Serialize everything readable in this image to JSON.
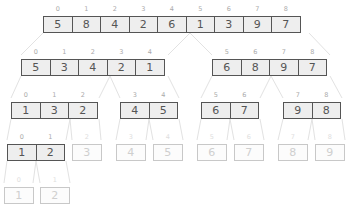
{
  "colors": {
    "active_border": "#555555",
    "active_fill": "#eeeeee",
    "faint_border": "#c8c8c8",
    "link": "#e2e2e2"
  },
  "levels": [
    {
      "level": 0,
      "arrays": [
        {
          "x": 43,
          "y": 16,
          "active": true,
          "cells": [
            {
              "i": "0",
              "v": "5"
            },
            {
              "i": "1",
              "v": "8"
            },
            {
              "i": "2",
              "v": "4"
            },
            {
              "i": "3",
              "v": "2"
            },
            {
              "i": "4",
              "v": "6"
            },
            {
              "i": "5",
              "v": "1"
            },
            {
              "i": "6",
              "v": "3"
            },
            {
              "i": "7",
              "v": "9"
            },
            {
              "i": "8",
              "v": "7"
            }
          ]
        }
      ]
    },
    {
      "level": 1,
      "arrays": [
        {
          "x": 21,
          "y": 59,
          "active": true,
          "cells": [
            {
              "i": "0",
              "v": "5"
            },
            {
              "i": "1",
              "v": "3"
            },
            {
              "i": "2",
              "v": "4"
            },
            {
              "i": "3",
              "v": "2"
            },
            {
              "i": "4",
              "v": "1"
            }
          ]
        },
        {
          "x": 212,
          "y": 59,
          "active": true,
          "cells": [
            {
              "i": "5",
              "v": "6"
            },
            {
              "i": "6",
              "v": "8"
            },
            {
              "i": "7",
              "v": "9"
            },
            {
              "i": "8",
              "v": "7"
            }
          ]
        }
      ]
    },
    {
      "level": 2,
      "arrays": [
        {
          "x": 11,
          "y": 102,
          "active": true,
          "cells": [
            {
              "i": "0",
              "v": "1"
            },
            {
              "i": "1",
              "v": "3"
            },
            {
              "i": "2",
              "v": "2"
            }
          ]
        },
        {
          "x": 120,
          "y": 102,
          "active": true,
          "cells": [
            {
              "i": "3",
              "v": "4"
            },
            {
              "i": "4",
              "v": "5"
            }
          ]
        },
        {
          "x": 201,
          "y": 102,
          "active": true,
          "cells": [
            {
              "i": "5",
              "v": "6"
            },
            {
              "i": "6",
              "v": "7"
            }
          ]
        },
        {
          "x": 283,
          "y": 102,
          "active": true,
          "cells": [
            {
              "i": "7",
              "v": "9"
            },
            {
              "i": "8",
              "v": "8"
            }
          ]
        }
      ]
    },
    {
      "level": 3,
      "arrays": [
        {
          "x": 7,
          "y": 144,
          "active": true,
          "cells": [
            {
              "i": "0",
              "v": "1"
            },
            {
              "i": "1",
              "v": "2"
            }
          ]
        },
        {
          "x": 72,
          "y": 144,
          "active": false,
          "cells": [
            {
              "i": "2",
              "v": "3"
            }
          ]
        },
        {
          "x": 116,
          "y": 144,
          "active": false,
          "cells": [
            {
              "i": "3",
              "v": "4"
            }
          ]
        },
        {
          "x": 153,
          "y": 144,
          "active": false,
          "cells": [
            {
              "i": "4",
              "v": "5"
            }
          ]
        },
        {
          "x": 197,
          "y": 144,
          "active": false,
          "cells": [
            {
              "i": "5",
              "v": "6"
            }
          ]
        },
        {
          "x": 234,
          "y": 144,
          "active": false,
          "cells": [
            {
              "i": "6",
              "v": "7"
            }
          ]
        },
        {
          "x": 278,
          "y": 144,
          "active": false,
          "cells": [
            {
              "i": "7",
              "v": "8"
            }
          ]
        },
        {
          "x": 315,
          "y": 144,
          "active": false,
          "cells": [
            {
              "i": "8",
              "v": "9"
            }
          ]
        }
      ]
    },
    {
      "level": 4,
      "arrays": [
        {
          "x": 4,
          "y": 187,
          "active": false,
          "cells": [
            {
              "i": "0",
              "v": "1"
            }
          ]
        },
        {
          "x": 40,
          "y": 187,
          "active": false,
          "cells": [
            {
              "i": "1",
              "v": "2"
            }
          ]
        }
      ]
    }
  ]
}
